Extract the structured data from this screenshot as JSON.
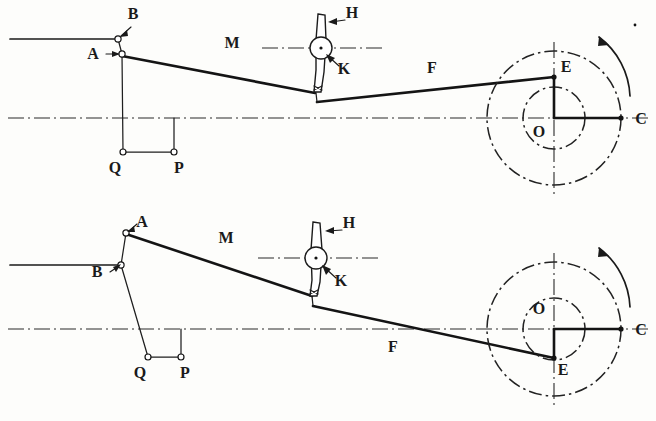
{
  "figure": {
    "background_color": "#fdfdfb",
    "ink_color": "#1a1a1a",
    "width": 656,
    "height": 421
  },
  "labels": {
    "A": "A",
    "B": "B",
    "C": "C",
    "E": "E",
    "F": "F",
    "H": "H",
    "K": "K",
    "M": "M",
    "O": "O",
    "P": "P",
    "Q": "Q"
  },
  "diagrams": [
    {
      "name": "upper-diagram",
      "position_description": "crank pin E above centre O",
      "centerline_y": 118,
      "crank_center": {
        "x": 554,
        "y": 118,
        "label": "O"
      },
      "crank_pin": {
        "x": 554,
        "y": 77,
        "label": "E"
      },
      "crank_end": {
        "x": 621,
        "y": 118,
        "label": "C"
      },
      "outer_circle_radius": 67,
      "inner_circle_radius": 31,
      "rotation_arrow": "counterclockwise",
      "points": [
        {
          "label": "B",
          "x": 118,
          "y": 39
        },
        {
          "label": "A",
          "x": 122,
          "y": 54
        },
        {
          "label": "Q",
          "x": 123,
          "y": 152
        },
        {
          "label": "P",
          "x": 174,
          "y": 152
        },
        {
          "label": "K",
          "x": 322,
          "y": 48
        },
        {
          "label": "E",
          "x": 554,
          "y": 77
        },
        {
          "label": "C",
          "x": 621,
          "y": 118
        }
      ],
      "links": [
        {
          "name": "M",
          "from": "A",
          "to": "lever-bottom",
          "label": "M",
          "label_x": 232,
          "label_y": 48
        },
        {
          "name": "F",
          "from": "lever-bottom",
          "to": "E",
          "label": "F",
          "label_x": 432,
          "label_y": 73
        },
        {
          "name": "H",
          "label": "H",
          "label_x": 348,
          "label_y": 18
        },
        {
          "name": "K",
          "label": "K",
          "label_x": 341,
          "label_y": 70
        }
      ],
      "label_positions": {
        "A": {
          "x": 93,
          "y": 59
        },
        "B": {
          "x": 133,
          "y": 19
        },
        "C": {
          "x": 639,
          "y": 124
        },
        "E": {
          "x": 563,
          "y": 72
        },
        "O": {
          "x": 539,
          "y": 137
        },
        "P": {
          "x": 178,
          "y": 172
        },
        "Q": {
          "x": 115,
          "y": 172
        }
      }
    },
    {
      "name": "lower-diagram",
      "position_description": "crank pin E below centre O",
      "centerline_y": 329,
      "crank_center": {
        "x": 554,
        "y": 329,
        "label": "O"
      },
      "crank_pin": {
        "x": 554,
        "y": 358,
        "label": "E"
      },
      "crank_end": {
        "x": 621,
        "y": 329,
        "label": "C"
      },
      "outer_circle_radius": 67,
      "inner_circle_radius": 31,
      "rotation_arrow": "counterclockwise",
      "points": [
        {
          "label": "A",
          "x": 126,
          "y": 233
        },
        {
          "label": "B",
          "x": 121,
          "y": 265
        },
        {
          "label": "Q",
          "x": 148,
          "y": 357
        },
        {
          "label": "P",
          "x": 181,
          "y": 357
        },
        {
          "label": "K",
          "x": 317,
          "y": 258
        },
        {
          "label": "E",
          "x": 554,
          "y": 358
        },
        {
          "label": "C",
          "x": 621,
          "y": 329
        }
      ],
      "links": [
        {
          "name": "M",
          "from": "A",
          "to": "lever-bottom",
          "label": "M",
          "label_x": 226,
          "label_y": 243
        },
        {
          "name": "F",
          "from": "lever-bottom",
          "to": "E",
          "label": "F",
          "label_x": 393,
          "label_y": 352
        },
        {
          "name": "H",
          "label": "H",
          "label_x": 345,
          "label_y": 228
        },
        {
          "name": "K",
          "label": "K",
          "label_x": 339,
          "label_y": 282
        }
      ],
      "label_positions": {
        "A": {
          "x": 139,
          "y": 227
        },
        "B": {
          "x": 96,
          "y": 274
        },
        "C": {
          "x": 639,
          "y": 335
        },
        "E": {
          "x": 562,
          "y": 373
        },
        "O": {
          "x": 539,
          "y": 314
        },
        "P": {
          "x": 184,
          "y": 377
        },
        "Q": {
          "x": 139,
          "y": 377
        }
      }
    }
  ]
}
